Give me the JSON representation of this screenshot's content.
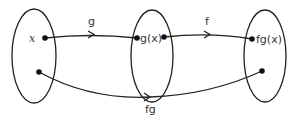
{
  "diagram": {
    "sets": [
      {
        "id": "domain",
        "element_label": "x"
      },
      {
        "id": "middle",
        "element_label": "g(x)"
      },
      {
        "id": "codomain",
        "element_label": "fg(x)"
      }
    ],
    "arrows": [
      {
        "id": "g",
        "label": "g",
        "from": "x",
        "to": "g(x)"
      },
      {
        "id": "f",
        "label": "f",
        "from": "g(x)",
        "to": "fg(x)"
      },
      {
        "id": "fg",
        "label": "fg",
        "from": "domain-point",
        "to": "codomain-point"
      }
    ],
    "colors": {
      "stroke": "#222222",
      "text": "#333333"
    }
  }
}
